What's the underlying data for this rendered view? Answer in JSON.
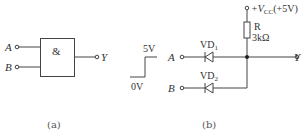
{
  "figure_a": {
    "caption": "(a)",
    "gate": {
      "symbol": "&",
      "type": "AND"
    },
    "inputs": [
      {
        "label": "A"
      },
      {
        "label": "B"
      }
    ],
    "output": {
      "label": "Y"
    }
  },
  "waveform": {
    "high_label": "5V",
    "low_label": "0V"
  },
  "figure_b": {
    "caption": "(b)",
    "supply": {
      "prefix": "+V",
      "sub": "CC",
      "suffix": "(+5V)"
    },
    "resistor": {
      "name": "R",
      "value": "3kΩ"
    },
    "diodes": [
      {
        "name": "VD",
        "sub": "1",
        "input": "A"
      },
      {
        "name": "VD",
        "sub": "2",
        "input": "B"
      }
    ],
    "output": {
      "label": "Y"
    }
  },
  "colors": {
    "line": "#444444",
    "text": "#333333",
    "background": "#ffffff"
  }
}
